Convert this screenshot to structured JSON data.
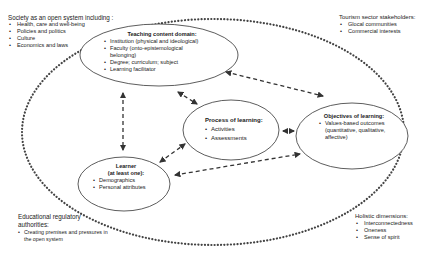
{
  "outer_labels": {
    "society": {
      "title": "Society as an open system including :",
      "items": [
        "Health, care and well-being",
        "Policies and politics",
        "Culture",
        "Economics and laws"
      ]
    },
    "tourism": {
      "title": "Tourism sector stakeholders:",
      "items": [
        "Glocal communities",
        "Commercial interests"
      ]
    },
    "regulatory": {
      "title": "Educational regulatory authorities:",
      "items": [
        "Creating premises and pressures in the open system"
      ]
    },
    "holistic": {
      "title": "Holistic dimensions:",
      "items": [
        "Interconnectedness",
        "Oneness",
        "Sense of spirit"
      ]
    }
  },
  "nodes": {
    "teaching": {
      "title": "Teaching content domain:",
      "items": [
        "Institution (physical and ideological)",
        "Faculty (onto-epistemological belonging)",
        "Degree; curriculum; subject",
        "Learning facilitator"
      ]
    },
    "process": {
      "title": "Process of learning:",
      "items": [
        "Activities",
        "Assessments"
      ]
    },
    "objectives": {
      "title": "Objectives of learning:",
      "items": [
        "Values-based outcomes (quantitative, qualitative, affective)"
      ]
    },
    "learner": {
      "title": "Learner",
      "subtitle": "(at least one):",
      "items": [
        "Demographics",
        "Personal attributes"
      ]
    }
  },
  "colors": {
    "line": "#333333",
    "dotted_boundary": "#444444",
    "background": "#ffffff"
  }
}
